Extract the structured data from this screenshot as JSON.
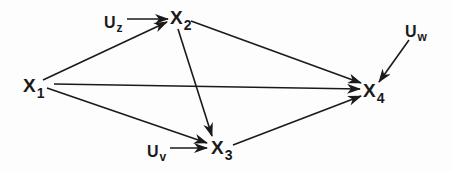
{
  "diagram": {
    "type": "path diagram",
    "nodes": [
      {
        "id": "X1",
        "main": "X",
        "sub": "1",
        "x": 23,
        "y": 76
      },
      {
        "id": "X2",
        "main": "X",
        "sub": "2",
        "x": 170,
        "y": 8
      },
      {
        "id": "X3",
        "main": "X",
        "sub": "3",
        "x": 211,
        "y": 138
      },
      {
        "id": "X4",
        "main": "X",
        "sub": "4",
        "x": 363,
        "y": 81
      },
      {
        "id": "Uz",
        "main": "U",
        "sub": "z",
        "x": 104,
        "y": 15
      },
      {
        "id": "Uv",
        "main": "U",
        "sub": "v",
        "x": 147,
        "y": 144
      },
      {
        "id": "Uw",
        "main": "U",
        "sub": "w",
        "x": 405,
        "y": 24
      }
    ],
    "edges": [
      {
        "from": "X1",
        "to": "X2"
      },
      {
        "from": "X1",
        "to": "X4"
      },
      {
        "from": "X1",
        "to": "X3"
      },
      {
        "from": "Uz",
        "to": "X2"
      },
      {
        "from": "X2",
        "to": "X4"
      },
      {
        "from": "X2",
        "to": "X3"
      },
      {
        "from": "Uv",
        "to": "X3"
      },
      {
        "from": "X3",
        "to": "X4"
      },
      {
        "from": "Uw",
        "to": "X4"
      }
    ],
    "colors": {
      "ink": "#1a1a1a",
      "background": "#fdfdfd"
    }
  }
}
